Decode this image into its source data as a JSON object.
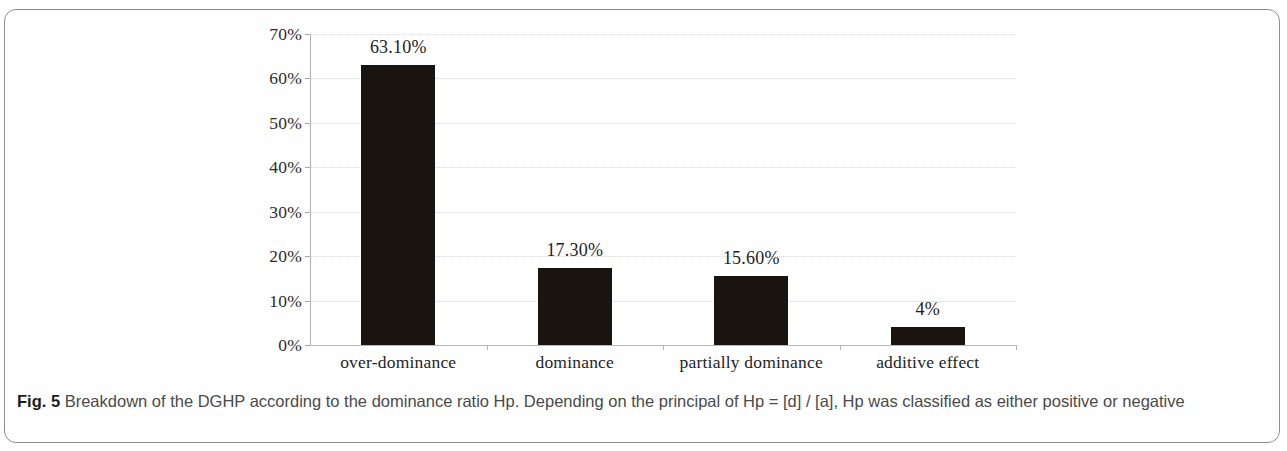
{
  "figure": {
    "caption_label": "Fig. 5",
    "caption_text": " Breakdown of the DGHP according to the dominance ratio Hp. Depending on the principal of Hp = [d] / [a], Hp was classified as either positive or negative",
    "border_color": "#8d8f92"
  },
  "chart_data": {
    "type": "bar",
    "title": "",
    "xlabel": "",
    "ylabel": "",
    "categories": [
      "over-dominance",
      "dominance",
      "partially dominance",
      "additive effect"
    ],
    "values": [
      63.1,
      17.3,
      15.6,
      4.0
    ],
    "value_labels": [
      "63.10%",
      "17.30%",
      "15.60%",
      "4%"
    ],
    "ylim": [
      0,
      70
    ],
    "ytick_values": [
      0,
      10,
      20,
      30,
      40,
      50,
      60,
      70
    ],
    "ytick_labels": [
      "0%",
      "10%",
      "20%",
      "30%",
      "40%",
      "50%",
      "60%",
      "70%"
    ],
    "grid": true,
    "legend": "none",
    "bar_color": "#1a1411",
    "gridline_color": "#d8d8d8",
    "axis_color": "#b0b0b0"
  }
}
